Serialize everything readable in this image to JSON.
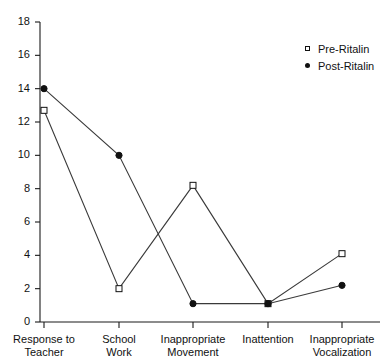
{
  "chart_data": {
    "type": "line",
    "title": "",
    "xlabel": "",
    "ylabel": "",
    "categories": [
      "Response to\nTeacher",
      "School\nWork",
      "Inappropriate\nMovement",
      "Inattention",
      "Inappropriate\nVocalization"
    ],
    "series": [
      {
        "name": "Pre-Ritalin",
        "marker": "open-square",
        "values": [
          12.7,
          2.0,
          8.2,
          1.1,
          4.1
        ]
      },
      {
        "name": "Post-Ritalin",
        "marker": "filled-circle",
        "values": [
          14.0,
          10.0,
          1.1,
          1.1,
          2.2
        ]
      }
    ],
    "ylim": [
      0,
      18
    ],
    "yticks": [
      0,
      2,
      4,
      6,
      8,
      10,
      12,
      14,
      16,
      18
    ],
    "ytick_labels": [
      "0",
      "2",
      "4",
      "6",
      "8",
      "10",
      "12",
      "14",
      "16",
      "18"
    ],
    "grid": false,
    "legend_position": "top-right",
    "line_color": "#3a3a3a",
    "axis_color": "#1a1a1a"
  },
  "legend": {
    "entries": [
      {
        "label": "Pre-Ritalin",
        "marker": "open-square-icon"
      },
      {
        "label": "Post-Ritalin",
        "marker": "filled-circle-icon"
      }
    ]
  }
}
